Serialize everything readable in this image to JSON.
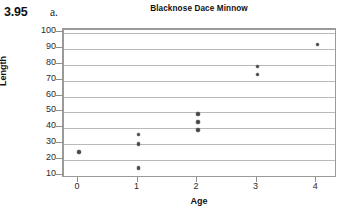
{
  "figure": {
    "exercise_number": "3.95",
    "part_label": "a."
  },
  "chart_data": {
    "type": "scatter",
    "title": "Blacknose Dace Minnow",
    "xlabel": "Age",
    "ylabel": "Length",
    "xlim": [
      -0.25,
      4.35
    ],
    "ylim": [
      8,
      102
    ],
    "xticks": [
      0,
      1,
      2,
      3,
      4
    ],
    "xtick_labels": [
      "0",
      "1",
      "2",
      "3",
      "4"
    ],
    "yticks": [
      10,
      20,
      30,
      40,
      50,
      60,
      70,
      80,
      90,
      100
    ],
    "ytick_labels": [
      "10",
      "20",
      "30",
      "40",
      "50",
      "60",
      "70",
      "80",
      "90",
      "100"
    ],
    "grid": "horizontal",
    "legend": "none",
    "marker_color": "#4a4a4a",
    "grid_color": "#b9b9b9",
    "frame_color": "#9a9a9a",
    "x": [
      0,
      1,
      1,
      1,
      2,
      2,
      2,
      3,
      3,
      4
    ],
    "y": [
      25,
      36,
      30,
      15,
      49,
      44,
      39,
      79,
      74,
      93
    ],
    "points": [
      {
        "age": 0,
        "length": 25
      },
      {
        "age": 1,
        "length": 36
      },
      {
        "age": 1,
        "length": 30
      },
      {
        "age": 1,
        "length": 15
      },
      {
        "age": 2,
        "length": 49
      },
      {
        "age": 2,
        "length": 44
      },
      {
        "age": 2,
        "length": 39
      },
      {
        "age": 3,
        "length": 79
      },
      {
        "age": 3,
        "length": 74
      },
      {
        "age": 4,
        "length": 93
      }
    ]
  }
}
